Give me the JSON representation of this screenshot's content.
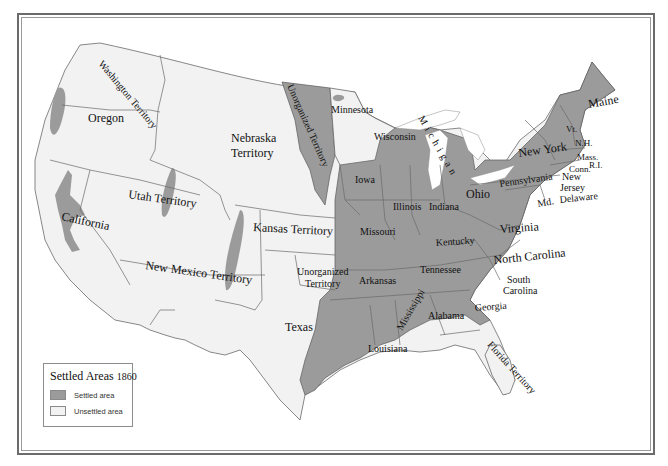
{
  "map": {
    "title": "Settled Areas 1860",
    "colors": {
      "settled": "#9b9b9b",
      "unsettled": "#f2f2f2",
      "border": "#6a6a6a"
    },
    "regions": [
      {
        "name": "Washington Territory",
        "status": "unsettled"
      },
      {
        "name": "Oregon",
        "status": "unsettled"
      },
      {
        "name": "California",
        "status": "unsettled"
      },
      {
        "name": "Utah Territory",
        "status": "unsettled"
      },
      {
        "name": "Nebraska Territory",
        "status": "unsettled"
      },
      {
        "name": "Kansas Territory",
        "status": "unsettled"
      },
      {
        "name": "New Mexico Territory",
        "status": "unsettled"
      },
      {
        "name": "Unorganized Territory (Dakota)",
        "status": "settled"
      },
      {
        "name": "Unorganized Territory (Indian)",
        "status": "unsettled"
      },
      {
        "name": "Texas",
        "status": "partial"
      },
      {
        "name": "Minnesota",
        "status": "unsettled"
      },
      {
        "name": "Wisconsin",
        "status": "partial"
      },
      {
        "name": "Michigan",
        "status": "partial"
      },
      {
        "name": "Florida Territory",
        "status": "partial"
      }
    ]
  },
  "labels": {
    "washington": "Washington Territory",
    "oregon": "Oregon",
    "california": "California",
    "utah": "Utah Territory",
    "nebraska_1": "Nebraska",
    "nebraska_2": "Territory",
    "kansas": "Kansas Territory",
    "new_mexico": "New Mexico Territory",
    "unorg_north": "Unorganized Territory",
    "unorg_south_1": "Unorganized",
    "unorg_south_2": "Territory",
    "texas": "Texas",
    "minnesota": "Minnesota",
    "wisconsin": "Wisconsin",
    "michigan": "Michigan",
    "iowa": "Iowa",
    "illinois": "Illinois",
    "indiana": "Indiana",
    "ohio": "Ohio",
    "missouri": "Missouri",
    "kentucky": "Kentucky",
    "virginia": "Virginia",
    "tennessee": "Tennessee",
    "north_carolina": "North Carolina",
    "south_carolina_1": "South",
    "south_carolina_2": "Carolina",
    "arkansas": "Arkansas",
    "mississippi": "Mississippi",
    "alabama": "Alabama",
    "georgia": "Georgia",
    "louisiana": "Louisiana",
    "florida": "Florida Territory",
    "pennsylvania": "Pennsylvania",
    "new_york": "New York",
    "new_jersey_1": "New",
    "new_jersey_2": "Jersey",
    "delaware": "Delaware",
    "maryland": "Md.",
    "vermont": "Vt.",
    "new_hampshire": "N.H.",
    "massachusetts": "Mass.",
    "connecticut": "Conn.",
    "rhode_island": "R.I.",
    "maine": "Maine"
  },
  "legend": {
    "title": "Settled Areas",
    "year": "1860",
    "items": [
      {
        "label": "Settled area",
        "color": "#9b9b9b"
      },
      {
        "label": "Unsettled area",
        "color": "#f2f2f2"
      }
    ]
  }
}
